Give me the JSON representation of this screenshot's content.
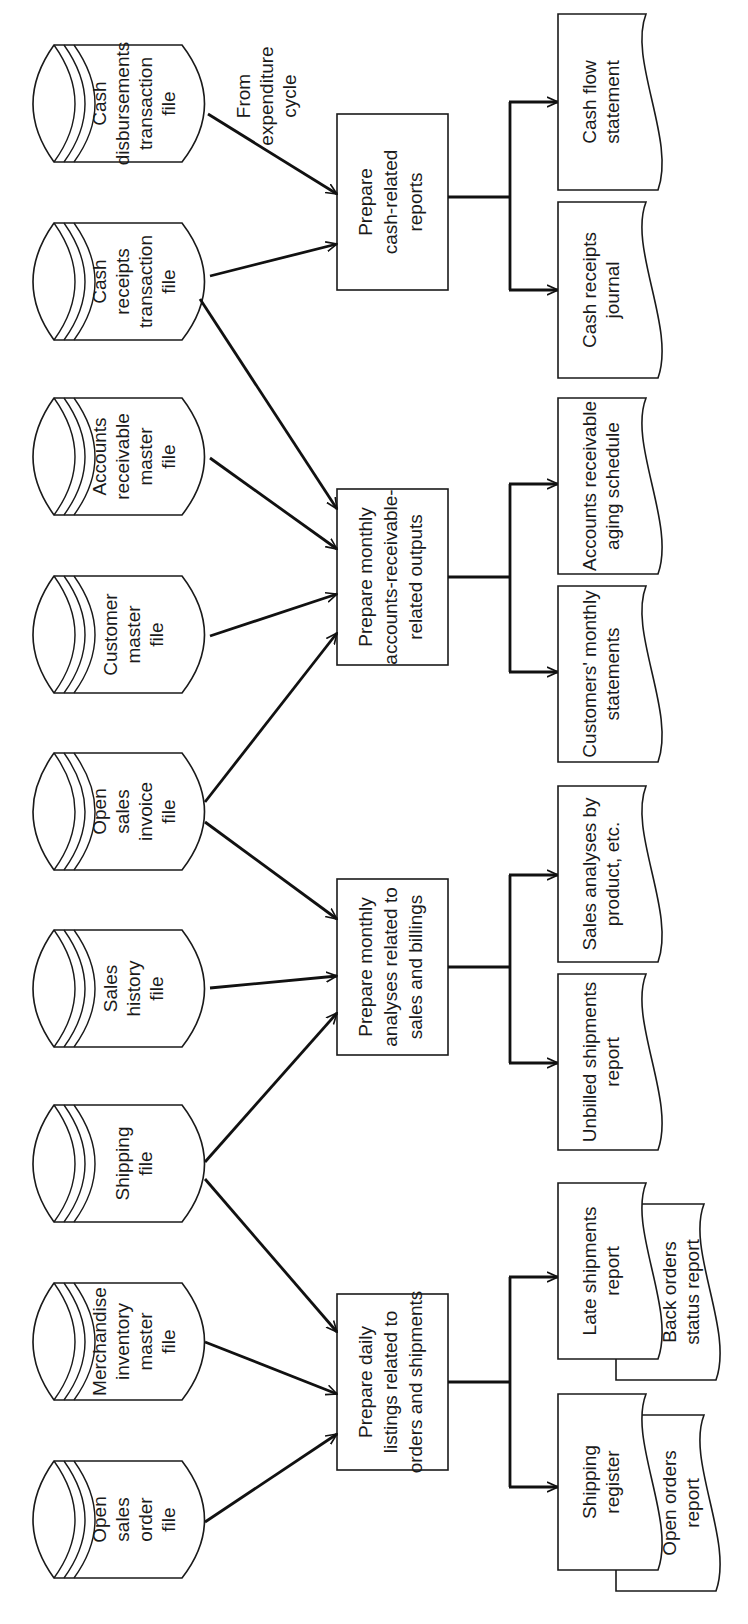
{
  "annotation": {
    "from_expenditure": [
      "From",
      "expenditure",
      "cycle"
    ]
  },
  "files": [
    {
      "id": "open-sales-order-file",
      "lines": [
        "Open",
        "sales",
        "order",
        "file"
      ]
    },
    {
      "id": "merchandise-inventory-master-file",
      "lines": [
        "Merchandise",
        "inventory",
        "master",
        "file"
      ]
    },
    {
      "id": "shipping-file",
      "lines": [
        "Shipping",
        "file"
      ]
    },
    {
      "id": "sales-history-file",
      "lines": [
        "Sales",
        "history",
        "file"
      ]
    },
    {
      "id": "open-sales-invoice-file",
      "lines": [
        "Open",
        "sales",
        "invoice",
        "file"
      ]
    },
    {
      "id": "customer-master-file",
      "lines": [
        "Customer",
        "master",
        "file"
      ]
    },
    {
      "id": "accounts-receivable-master-file",
      "lines": [
        "Accounts",
        "receivable",
        "master",
        "file"
      ]
    },
    {
      "id": "cash-receipts-transaction-file",
      "lines": [
        "Cash",
        "receipts",
        "transaction",
        "file"
      ]
    },
    {
      "id": "cash-disbursements-transaction-file",
      "lines": [
        "Cash",
        "disbursements",
        "transaction",
        "file"
      ]
    }
  ],
  "processes": [
    {
      "id": "daily-listings",
      "lines": [
        "Prepare daily",
        "listings related to",
        "orders and shipments"
      ]
    },
    {
      "id": "monthly-sales-analyses",
      "lines": [
        "Prepare monthly",
        "analyses related to",
        "sales and billings"
      ]
    },
    {
      "id": "monthly-ar-outputs",
      "lines": [
        "Prepare monthly",
        "accounts-receivable-",
        "related outputs"
      ]
    },
    {
      "id": "cash-related-reports",
      "lines": [
        "Prepare",
        "cash-related",
        "reports"
      ]
    }
  ],
  "documents": [
    {
      "id": "shipping-register",
      "lines": [
        "Shipping",
        "register"
      ]
    },
    {
      "id": "open-orders-report",
      "lines": [
        "Open orders",
        "report"
      ]
    },
    {
      "id": "late-shipments-report",
      "lines": [
        "Late shipments",
        "report"
      ]
    },
    {
      "id": "back-orders-status-report",
      "lines": [
        "Back orders",
        "status report"
      ]
    },
    {
      "id": "unbilled-shipments-report",
      "lines": [
        "Unbilled shipments",
        "report"
      ]
    },
    {
      "id": "sales-analyses-by-product",
      "lines": [
        "Sales analyses by",
        "product, etc."
      ]
    },
    {
      "id": "customers-monthly-statements",
      "lines": [
        "Customers' monthly",
        "statements"
      ]
    },
    {
      "id": "ar-aging-schedule",
      "lines": [
        "Accounts receivable",
        "aging schedule"
      ]
    },
    {
      "id": "cash-receipts-journal",
      "lines": [
        "Cash receipts",
        "journal"
      ]
    },
    {
      "id": "cash-flow-statement",
      "lines": [
        "Cash flow",
        "statement"
      ]
    }
  ],
  "colors": {
    "ink": "#1a1a1a",
    "background": "#ffffff"
  }
}
